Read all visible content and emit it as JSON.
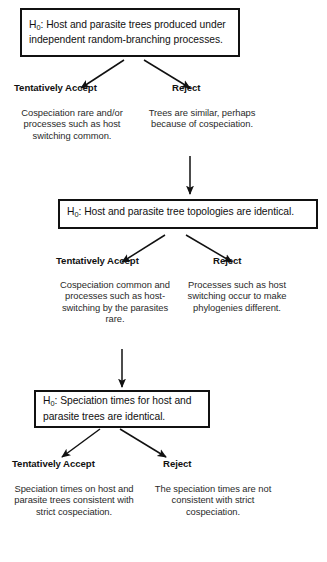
{
  "diagram": {
    "accent_color": "#111111",
    "box_border_color": "#111111",
    "text_color": "#1a1a1a",
    "background_color": "#ffffff"
  },
  "stages": [
    {
      "id": "stage-1",
      "hypothesis": {
        "prefix": "H",
        "subscript": "0",
        "statement": ": Host and parasite trees produced under independent random-branching processes."
      },
      "accept": {
        "heading": "Tentatively Accept",
        "body": "Cospeciation rare and/or processes such as host switching common."
      },
      "reject": {
        "heading": "Reject",
        "body": "Trees are similar, perhaps because of cospeciation."
      }
    },
    {
      "id": "stage-2",
      "hypothesis": {
        "prefix": "H",
        "subscript": "0",
        "statement": ": Host and parasite tree topologies are identical."
      },
      "accept": {
        "heading": "Tentatively Accept",
        "body": "Cospeciation common and processes such as host-switching by the parasites rare."
      },
      "reject": {
        "heading": "Reject",
        "body": "Processes such as host switching occur to make phylogenies different."
      }
    },
    {
      "id": "stage-3",
      "hypothesis": {
        "prefix": "H",
        "subscript": "0",
        "statement": ": Speciation times for host and parasite trees are identical."
      },
      "accept": {
        "heading": "Tentatively Accept",
        "body": "Speciation times on host and parasite trees consistent with strict cospeciation."
      },
      "reject": {
        "heading": "Reject",
        "body": "The speciation times are not consistent with strict cospeciation."
      }
    }
  ]
}
